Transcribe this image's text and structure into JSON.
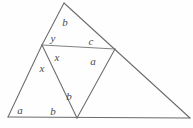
{
  "figure": {
    "stroke_color": "#6b6b6b",
    "background_color": "#fefefe",
    "label_color": "#4a4a4a",
    "width": 193,
    "height": 128,
    "vertices": [
      {
        "id": "left-base",
        "x": 8,
        "y": 117
      },
      {
        "id": "bottom-mid",
        "x": 77,
        "y": 118
      },
      {
        "id": "right-base",
        "x": 190,
        "y": 118
      },
      {
        "id": "apex-top",
        "x": 64,
        "y": 3
      },
      {
        "id": "left-mid",
        "x": 42,
        "y": 45
      },
      {
        "id": "right-mid",
        "x": 115,
        "y": 49
      }
    ],
    "segments": [
      {
        "id": "baseline",
        "from": "left-base",
        "to": "right-base"
      },
      {
        "id": "left-outer-edge",
        "from": "left-base",
        "to": "left-mid"
      },
      {
        "id": "upper-left-edge",
        "from": "left-mid",
        "to": "apex-top"
      },
      {
        "id": "long-right-edge",
        "from": "apex-top",
        "to": "right-base"
      },
      {
        "id": "horizontal-crossbar",
        "from": "left-mid",
        "to": "right-mid"
      },
      {
        "id": "left-mid-to-bottom",
        "from": "left-mid",
        "to": "bottom-mid"
      },
      {
        "id": "bottom-to-right-mid",
        "from": "bottom-mid",
        "to": "right-mid"
      }
    ],
    "labels": [
      {
        "id": "label-b-top",
        "text": "b",
        "x": 65,
        "y": 22
      },
      {
        "id": "label-y",
        "text": "y",
        "x": 53,
        "y": 38
      },
      {
        "id": "label-c",
        "text": "c",
        "x": 91,
        "y": 41
      },
      {
        "id": "label-x-inner",
        "text": "x",
        "x": 57,
        "y": 57
      },
      {
        "id": "label-a-right",
        "text": "a",
        "x": 93,
        "y": 61
      },
      {
        "id": "label-x-left",
        "text": "x",
        "x": 42,
        "y": 68
      },
      {
        "id": "label-b-middle",
        "text": "b",
        "x": 69,
        "y": 96
      },
      {
        "id": "label-a-bottom",
        "text": "a",
        "x": 20,
        "y": 110
      },
      {
        "id": "label-b-bottom",
        "text": "b",
        "x": 53,
        "y": 111
      }
    ]
  }
}
